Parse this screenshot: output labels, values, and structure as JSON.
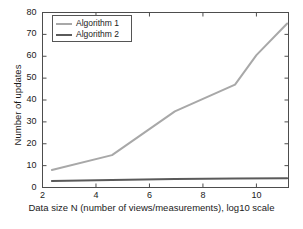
{
  "chart_data": {
    "type": "line",
    "title": "",
    "xlabel": "Data size N (number of views/measurements), log10 scale",
    "ylabel": "Number of updates",
    "xlim": [
      2,
      11.2
    ],
    "ylim": [
      0,
      80
    ],
    "xticks": [
      2,
      4,
      6,
      8,
      10
    ],
    "yticks": [
      0,
      10,
      20,
      30,
      40,
      50,
      60,
      70,
      80
    ],
    "xtick_labels": [
      "2",
      "4",
      "6",
      "8",
      "10"
    ],
    "ytick_labels": [
      "0",
      "10",
      "20",
      "30",
      "40",
      "50",
      "60",
      "70",
      "80"
    ],
    "grid": false,
    "legend_position": "upper left",
    "series": [
      {
        "name": "Algorithm 1",
        "color": "#a8a8a8",
        "line_width": 2,
        "x": [
          2.35,
          4.6,
          6.95,
          9.2,
          10.0,
          11.15
        ],
        "y": [
          8,
          14.8,
          34.8,
          47,
          60.5,
          75
        ]
      },
      {
        "name": "Algorithm 2",
        "color": "#5a5a5a",
        "line_width": 2,
        "x": [
          2.35,
          4.6,
          6.95,
          9.2,
          11.15
        ],
        "y": [
          3.0,
          3.4,
          3.9,
          4.1,
          4.2
        ]
      }
    ]
  },
  "legend": {
    "entries": [
      {
        "label": "Algorithm 1"
      },
      {
        "label": "Algorithm 2"
      }
    ]
  },
  "axes": {
    "frame_color": "#4d4d4d"
  }
}
